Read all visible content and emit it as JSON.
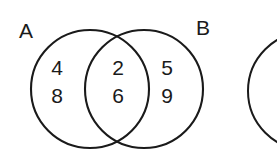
{
  "diagram": {
    "type": "venn-diagram",
    "title": "",
    "background_color": "#ffffff",
    "stroke_color": "#1a1a1a",
    "text_color": "#1a1a1a",
    "sets": [
      {
        "id": "A",
        "label": "A",
        "label_x": 26,
        "label_y": 32,
        "center_x": 90,
        "center_y": 89,
        "radius": 59
      },
      {
        "id": "B",
        "label": "B",
        "label_x": 203,
        "label_y": 29,
        "center_x": 144,
        "center_y": 89,
        "radius": 59
      }
    ],
    "regions": [
      {
        "id": "A-only",
        "name": "left-only-region",
        "elements": [
          "4",
          "8"
        ],
        "center_x": 57,
        "positions_y": [
          69,
          97
        ]
      },
      {
        "id": "A-and-B",
        "name": "intersection-region",
        "elements": [
          "2",
          "6"
        ],
        "center_x": 118,
        "positions_y": [
          69,
          97
        ]
      },
      {
        "id": "B-only",
        "name": "right-only-region",
        "elements": [
          "5",
          "9"
        ],
        "center_x": 167,
        "positions_y": [
          69,
          97
        ]
      }
    ],
    "partial_shape": {
      "id": "partial-circle",
      "name": "cut-off-circle",
      "center_x": 307,
      "center_y": 91,
      "radius": 59
    }
  }
}
